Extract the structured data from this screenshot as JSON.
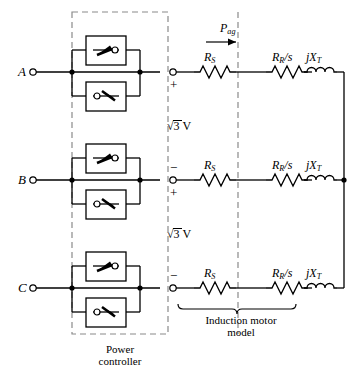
{
  "diagram": {
    "terminals": [
      {
        "name": "A",
        "label": "A"
      },
      {
        "name": "B",
        "label": "B"
      },
      {
        "name": "C",
        "label": "C"
      }
    ],
    "power_controller": {
      "caption_line1": "Power",
      "caption_line2": "controller",
      "switch_symbol": "thyristor",
      "pairs_per_phase": 2,
      "connection": "antiparallel"
    },
    "motor_model": {
      "caption_line1": "Induction motor",
      "caption_line2": "model",
      "elements": [
        {
          "symbol": "resistor",
          "base": "R",
          "sub": "S",
          "text": "R_S"
        },
        {
          "symbol": "resistor",
          "base": "R",
          "sub": "R",
          "suffix": "/s",
          "text": "R_R/s"
        },
        {
          "symbol": "inductor",
          "base": "jX",
          "sub": "T",
          "text": "jX_T"
        }
      ]
    },
    "power_flow": {
      "base": "P",
      "sub": "ag",
      "text": "P_ag",
      "direction": "right"
    },
    "voltage_labels": [
      {
        "text": "3 V",
        "prefix": "radical",
        "full": "√3 V",
        "between": "A-B"
      },
      {
        "text": "3 V",
        "prefix": "radical",
        "full": "√3 V",
        "between": "B-C"
      }
    ],
    "polarity": [
      {
        "sign": "+",
        "at": "A-lower"
      },
      {
        "sign": "−",
        "at": "B-upper"
      },
      {
        "sign": "+",
        "at": "B-lower"
      },
      {
        "sign": "−",
        "at": "C-upper"
      }
    ],
    "colors": {
      "line": "#000000",
      "dashed": "#888888",
      "background": "#ffffff"
    }
  }
}
